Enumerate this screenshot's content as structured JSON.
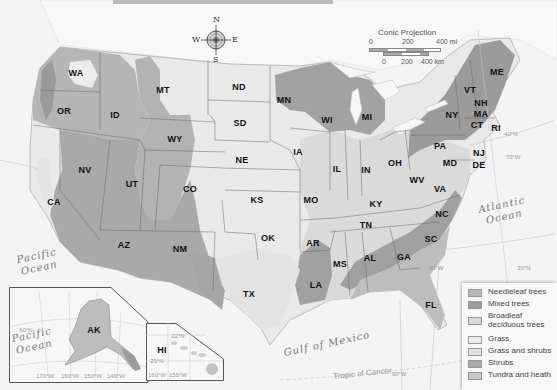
{
  "map": {
    "projection_label": "Conic Projection",
    "scale": {
      "miles_ticks": [
        "0",
        "200",
        "400 mi"
      ],
      "km_ticks": [
        "0",
        "200",
        "400 km"
      ]
    },
    "compass": {
      "n": "N",
      "s": "S",
      "e": "E",
      "w": "W"
    },
    "colors": {
      "needleleaf": "#b5b5b5",
      "mixed": "#9e9e9e",
      "broadleaf": "#d9d9d9",
      "grass": "#e9e9e9",
      "grass_shrubs": "#e2e2e2",
      "shrubs": "#a9a9a9",
      "tundra": "#c4c4c4",
      "water": "#f6f6f6",
      "outside": "#f1f1f1"
    },
    "states": [
      {
        "abbr": "WA",
        "x": 76,
        "y": 73
      },
      {
        "abbr": "OR",
        "x": 64,
        "y": 111
      },
      {
        "abbr": "ID",
        "x": 115,
        "y": 115
      },
      {
        "abbr": "MT",
        "x": 163,
        "y": 90
      },
      {
        "abbr": "WY",
        "x": 175,
        "y": 139
      },
      {
        "abbr": "ND",
        "x": 239,
        "y": 87
      },
      {
        "abbr": "SD",
        "x": 240,
        "y": 123
      },
      {
        "abbr": "NE",
        "x": 242,
        "y": 160
      },
      {
        "abbr": "NV",
        "x": 85,
        "y": 170
      },
      {
        "abbr": "UT",
        "x": 132,
        "y": 184
      },
      {
        "abbr": "CO",
        "x": 190,
        "y": 189
      },
      {
        "abbr": "CA",
        "x": 54,
        "y": 202
      },
      {
        "abbr": "KS",
        "x": 257,
        "y": 200
      },
      {
        "abbr": "AZ",
        "x": 124,
        "y": 245
      },
      {
        "abbr": "NM",
        "x": 180,
        "y": 249
      },
      {
        "abbr": "OK",
        "x": 268,
        "y": 238
      },
      {
        "abbr": "TX",
        "x": 249,
        "y": 294
      },
      {
        "abbr": "MN",
        "x": 284,
        "y": 100
      },
      {
        "abbr": "WI",
        "x": 327,
        "y": 120
      },
      {
        "abbr": "MI",
        "x": 367,
        "y": 117
      },
      {
        "abbr": "IA",
        "x": 298,
        "y": 152
      },
      {
        "abbr": "IL",
        "x": 337,
        "y": 169
      },
      {
        "abbr": "IN",
        "x": 366,
        "y": 170
      },
      {
        "abbr": "OH",
        "x": 395,
        "y": 163
      },
      {
        "abbr": "MO",
        "x": 311,
        "y": 200
      },
      {
        "abbr": "KY",
        "x": 376,
        "y": 204
      },
      {
        "abbr": "WV",
        "x": 417,
        "y": 180
      },
      {
        "abbr": "VA",
        "x": 440,
        "y": 189
      },
      {
        "abbr": "TN",
        "x": 366,
        "y": 225
      },
      {
        "abbr": "NC",
        "x": 442,
        "y": 214
      },
      {
        "abbr": "SC",
        "x": 431,
        "y": 239
      },
      {
        "abbr": "AR",
        "x": 313,
        "y": 243
      },
      {
        "abbr": "MS",
        "x": 340,
        "y": 264
      },
      {
        "abbr": "AL",
        "x": 370,
        "y": 258
      },
      {
        "abbr": "GA",
        "x": 404,
        "y": 257
      },
      {
        "abbr": "LA",
        "x": 316,
        "y": 285
      },
      {
        "abbr": "FL",
        "x": 431,
        "y": 305
      },
      {
        "abbr": "PA",
        "x": 440,
        "y": 146
      },
      {
        "abbr": "NY",
        "x": 452,
        "y": 115
      },
      {
        "abbr": "VT",
        "x": 470,
        "y": 90
      },
      {
        "abbr": "NH",
        "x": 481,
        "y": 103
      },
      {
        "abbr": "ME",
        "x": 497,
        "y": 72
      },
      {
        "abbr": "MA",
        "x": 481,
        "y": 114
      },
      {
        "abbr": "CT",
        "x": 477,
        "y": 125
      },
      {
        "abbr": "RI",
        "x": 496,
        "y": 128
      },
      {
        "abbr": "NJ",
        "x": 479,
        "y": 153
      },
      {
        "abbr": "MD",
        "x": 450,
        "y": 163
      },
      {
        "abbr": "DE",
        "x": 479,
        "y": 165
      },
      {
        "abbr": "AK",
        "x": 94,
        "y": 330
      },
      {
        "abbr": "HI",
        "x": 162,
        "y": 350
      }
    ],
    "water_labels": [
      {
        "name": "Pacific Ocean",
        "line1": "Pacific",
        "line2": "Ocean",
        "x": 38,
        "y": 262
      },
      {
        "name": "Atlantic Ocean",
        "line1": "Atlantic",
        "line2": "Ocean",
        "x": 503,
        "y": 211
      },
      {
        "name": "Gulf of Mexico",
        "line1": "Gulf of Mexico",
        "line2": "",
        "x": 327,
        "y": 344
      },
      {
        "name": "Pacific Ocean (Alaska inset)",
        "line1": "Pacific",
        "line2": "Ocean",
        "x": 33,
        "y": 341
      }
    ],
    "graticule_labels": [
      {
        "text": "90°W",
        "x": 399,
        "y": 374
      },
      {
        "text": "80°W",
        "x": 436,
        "y": 268
      },
      {
        "text": "30°N",
        "x": 524,
        "y": 268
      },
      {
        "text": "70°W",
        "x": 513,
        "y": 157
      },
      {
        "text": "40°N",
        "x": 511,
        "y": 134
      },
      {
        "text": "170°W",
        "x": 45,
        "y": 376
      },
      {
        "text": "160°W",
        "x": 70,
        "y": 376
      },
      {
        "text": "150°W",
        "x": 93,
        "y": 376
      },
      {
        "text": "140°W",
        "x": 116,
        "y": 376
      },
      {
        "text": "60°N",
        "x": 26,
        "y": 330
      },
      {
        "text": "160°W",
        "x": 157,
        "y": 375
      },
      {
        "text": "155°W",
        "x": 178,
        "y": 375
      },
      {
        "text": "22°N",
        "x": 178,
        "y": 336
      },
      {
        "text": "20°N",
        "x": 157,
        "y": 361
      }
    ],
    "tropic_label": "Tropic of Cancer"
  },
  "legend": {
    "items": [
      {
        "label": "Needleleaf trees",
        "color": "#b7b7b7"
      },
      {
        "label": "Mixed trees",
        "color": "#9b9b9b"
      },
      {
        "label": "Broadleaf deciduous trees",
        "color": "#dadada"
      },
      {
        "label": "Grass",
        "color": "#ececec"
      },
      {
        "label": "Grass and shrubs",
        "color": "#e3e3e3"
      },
      {
        "label": "Shrubs",
        "color": "#ababab"
      },
      {
        "label": "Tundra and heath",
        "color": "#c6c6c6"
      }
    ]
  }
}
